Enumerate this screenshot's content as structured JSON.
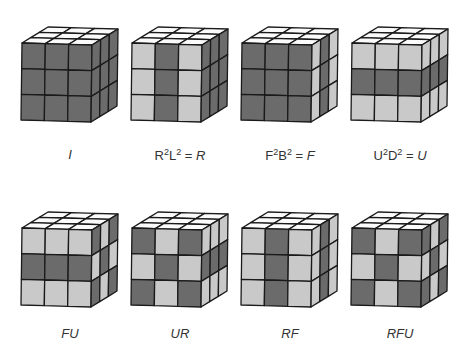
{
  "colors": {
    "dark": "#6b6b6b",
    "light": "#c9c9c9",
    "top": "#fbfbfb",
    "edge": "#1a1a1a"
  },
  "cubes": [
    {
      "id": "I",
      "label_html": "<i>I</i>",
      "label_text": "I",
      "front": [
        [
          "D",
          "D",
          "D"
        ],
        [
          "D",
          "D",
          "D"
        ],
        [
          "D",
          "D",
          "D"
        ]
      ],
      "side": [
        [
          "D",
          "D",
          "D"
        ],
        [
          "D",
          "D",
          "D"
        ],
        [
          "D",
          "D",
          "D"
        ]
      ]
    },
    {
      "id": "R2L2",
      "label_html": "R<sup>2</sup>L<sup>2</sup> = <i>R</i>",
      "label_text": "R²L² = R",
      "front": [
        [
          "L",
          "D",
          "L"
        ],
        [
          "L",
          "D",
          "L"
        ],
        [
          "L",
          "D",
          "L"
        ]
      ],
      "side": [
        [
          "D",
          "D",
          "D"
        ],
        [
          "D",
          "D",
          "D"
        ],
        [
          "D",
          "D",
          "D"
        ]
      ]
    },
    {
      "id": "F2B2",
      "label_html": "F<sup>2</sup>B<sup>2</sup> = <i>F</i>",
      "label_text": "F²B² = F",
      "front": [
        [
          "D",
          "D",
          "D"
        ],
        [
          "D",
          "D",
          "D"
        ],
        [
          "D",
          "D",
          "D"
        ]
      ],
      "side": [
        [
          "L",
          "D",
          "L"
        ],
        [
          "L",
          "D",
          "L"
        ],
        [
          "L",
          "D",
          "L"
        ]
      ]
    },
    {
      "id": "U2D2",
      "label_html": "U<sup>2</sup>D<sup>2</sup> = <i>U</i>",
      "label_text": "U²D² = U",
      "front": [
        [
          "L",
          "L",
          "L"
        ],
        [
          "D",
          "D",
          "D"
        ],
        [
          "L",
          "L",
          "L"
        ]
      ],
      "side": [
        [
          "L",
          "L",
          "L"
        ],
        [
          "D",
          "D",
          "D"
        ],
        [
          "L",
          "L",
          "L"
        ]
      ]
    },
    {
      "id": "FU",
      "label_html": "<i>FU</i>",
      "label_text": "FU",
      "front": [
        [
          "L",
          "L",
          "L"
        ],
        [
          "D",
          "D",
          "D"
        ],
        [
          "L",
          "L",
          "L"
        ]
      ],
      "side": [
        [
          "D",
          "L",
          "D"
        ],
        [
          "L",
          "D",
          "L"
        ],
        [
          "D",
          "L",
          "D"
        ]
      ]
    },
    {
      "id": "UR",
      "label_html": "<i>UR</i>",
      "label_text": "UR",
      "front": [
        [
          "D",
          "L",
          "D"
        ],
        [
          "L",
          "D",
          "L"
        ],
        [
          "D",
          "L",
          "D"
        ]
      ],
      "side": [
        [
          "L",
          "L",
          "L"
        ],
        [
          "D",
          "D",
          "D"
        ],
        [
          "L",
          "L",
          "L"
        ]
      ]
    },
    {
      "id": "RF",
      "label_html": "<i>RF</i>",
      "label_text": "RF",
      "front": [
        [
          "L",
          "D",
          "L"
        ],
        [
          "L",
          "D",
          "L"
        ],
        [
          "L",
          "D",
          "L"
        ]
      ],
      "side": [
        [
          "L",
          "D",
          "L"
        ],
        [
          "L",
          "D",
          "L"
        ],
        [
          "L",
          "D",
          "L"
        ]
      ]
    },
    {
      "id": "RFU",
      "label_html": "<i>RFU</i>",
      "label_text": "RFU",
      "front": [
        [
          "D",
          "L",
          "D"
        ],
        [
          "L",
          "D",
          "L"
        ],
        [
          "D",
          "L",
          "D"
        ]
      ],
      "side": [
        [
          "D",
          "L",
          "D"
        ],
        [
          "L",
          "D",
          "L"
        ],
        [
          "D",
          "L",
          "D"
        ]
      ]
    }
  ],
  "layout": {
    "origins": [
      [
        15,
        20
      ],
      [
        125,
        20
      ],
      [
        235,
        20
      ],
      [
        345,
        20
      ],
      [
        15,
        205
      ],
      [
        125,
        205
      ],
      [
        235,
        205
      ],
      [
        345,
        205
      ]
    ],
    "label_pos": [
      [
        12,
        147
      ],
      [
        122,
        147
      ],
      [
        232,
        147
      ],
      [
        342,
        147
      ],
      [
        12,
        326
      ],
      [
        122,
        326
      ],
      [
        232,
        326
      ],
      [
        342,
        326
      ]
    ]
  }
}
